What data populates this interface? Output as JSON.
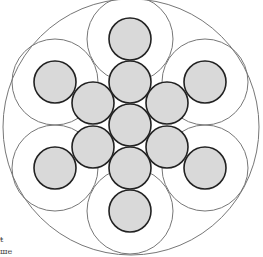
{
  "diagram": {
    "outer_circle": {
      "cx": 131,
      "cy": 127,
      "r": 128
    },
    "strand_fill": "#d9d9d9",
    "strand_stroke": "#222222",
    "thin_stroke": "#777777",
    "strand_r": 21,
    "sheath_r": 43,
    "center_strand": {
      "cx": 130,
      "cy": 125
    },
    "inner_ring": [
      {
        "cx": 130,
        "cy": 82
      },
      {
        "cx": 167,
        "cy": 103
      },
      {
        "cx": 167,
        "cy": 147
      },
      {
        "cx": 130,
        "cy": 168
      },
      {
        "cx": 93,
        "cy": 147
      },
      {
        "cx": 93,
        "cy": 103
      }
    ],
    "outer_ring": [
      {
        "cx": 130,
        "cy": 39
      },
      {
        "cx": 205,
        "cy": 82
      },
      {
        "cx": 205,
        "cy": 168
      },
      {
        "cx": 130,
        "cy": 211
      },
      {
        "cx": 55,
        "cy": 168
      },
      {
        "cx": 55,
        "cy": 82
      }
    ]
  },
  "fragments": {
    "line1": "ŧ",
    "line2": "ше"
  }
}
